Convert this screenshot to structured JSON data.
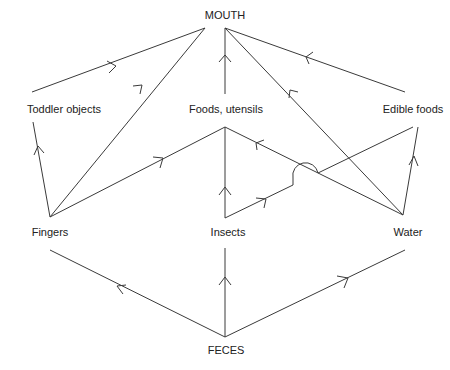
{
  "diagram": {
    "type": "flow",
    "nodes": {
      "mouth": "MOUTH",
      "toddler_objects": "Toddler objects",
      "foods_utensils": "Foods, utensils",
      "edible_foods": "Edible foods",
      "fingers": "Fingers",
      "insects": "Insects",
      "water": "Water",
      "feces": "FECES"
    },
    "edges": [
      {
        "from": "Toddler objects",
        "to": "MOUTH"
      },
      {
        "from": "Fingers",
        "to": "MOUTH"
      },
      {
        "from": "Foods, utensils",
        "to": "MOUTH"
      },
      {
        "from": "Water",
        "to": "MOUTH"
      },
      {
        "from": "Edible foods",
        "to": "MOUTH"
      },
      {
        "from": "Fingers",
        "to": "Toddler objects"
      },
      {
        "from": "Fingers",
        "to": "Foods, utensils"
      },
      {
        "from": "Insects",
        "to": "Foods, utensils"
      },
      {
        "from": "Water",
        "to": "Foods, utensils"
      },
      {
        "from": "Insects",
        "to": "Edible foods"
      },
      {
        "from": "Water",
        "to": "Edible foods"
      },
      {
        "from": "FECES",
        "to": "Fingers"
      },
      {
        "from": "FECES",
        "to": "Insects"
      },
      {
        "from": "FECES",
        "to": "Water"
      }
    ],
    "colors": {
      "line": "#3a3a3a",
      "text": "#222222",
      "background": "#ffffff"
    }
  }
}
